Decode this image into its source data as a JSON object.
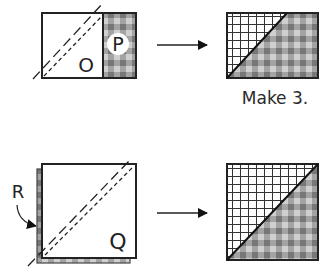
{
  "diagram": {
    "row1": {
      "left": {
        "square_label": "O",
        "strip_label": "P"
      },
      "caption": "Make 3."
    },
    "row2": {
      "left": {
        "square_label": "Q",
        "under_label": "R"
      }
    }
  },
  "colors": {
    "line": "#222222",
    "gingham_dark": "#7a7a7a",
    "gingham_mid": "#a8a8a8",
    "gingham_light": "#d0d0d0",
    "grid": "#333333"
  }
}
